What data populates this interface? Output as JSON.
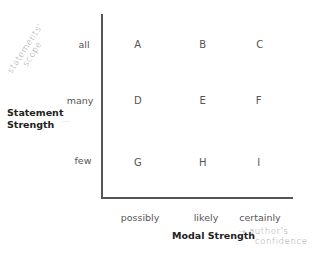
{
  "y_axis": {
    "title_line1": "Statement",
    "title_line2": "Strength",
    "annotation": "statements' scope",
    "annotation_line1": "statements'",
    "annotation_line2": "scope",
    "levels": [
      "all",
      "many",
      "few"
    ]
  },
  "x_axis": {
    "title": "Modal Strength",
    "annotation_arrow": "→",
    "annotation_line1": "author's",
    "annotation_line2": "confidence",
    "levels": [
      "possibly",
      "likely",
      "certainly"
    ]
  },
  "grid": {
    "rows": [
      [
        "A",
        "B",
        "C"
      ],
      [
        "D",
        "E",
        "F"
      ],
      [
        "G",
        "H",
        "I"
      ]
    ]
  },
  "colors": {
    "axis": "#555555",
    "text": "#555555",
    "title": "#222222",
    "handwriting": "#9a9a9a"
  }
}
